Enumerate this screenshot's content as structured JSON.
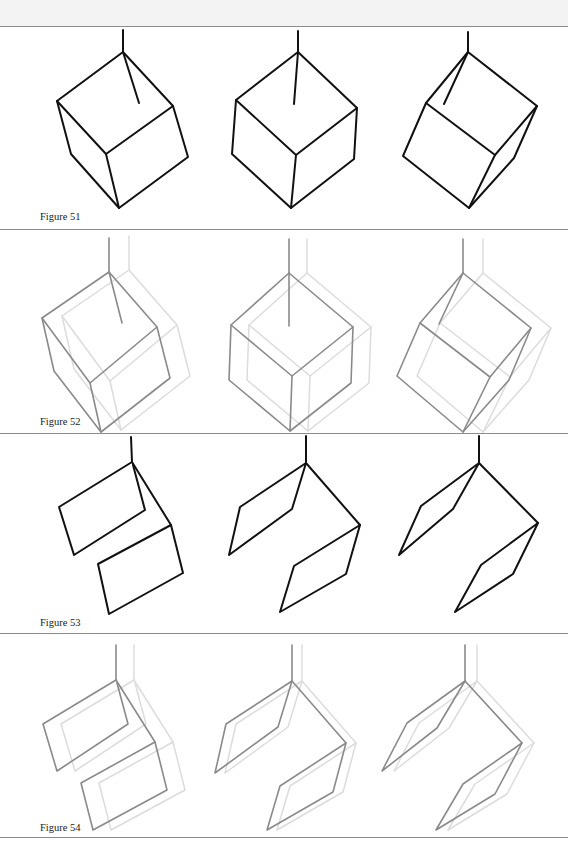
{
  "page": {
    "background": "#ffffff",
    "header_strip_color": "#f3f3f3",
    "rule_color": "#8c8c8c"
  },
  "figures": [
    {
      "id": "51",
      "caption": "Figure 51",
      "style": "solid",
      "stroke": "#111111",
      "description": "Three line-drawn cubes hanging from a vertical stem at the top vertex, each progressively rotated",
      "items": [
        "cube-1",
        "cube-2",
        "cube-3"
      ]
    },
    {
      "id": "52",
      "caption": "Figure 52",
      "style": "gray-with-ghost",
      "stroke": "#8a8a8a",
      "ghost_stroke": "#dcdcdc",
      "description": "The cubes of Figure 51 drawn in gray with faint offset ghost copies",
      "items": [
        "cube-1",
        "cube-2",
        "cube-3"
      ]
    },
    {
      "id": "53",
      "caption": "Figure 53",
      "style": "solid",
      "stroke": "#111111",
      "description": "Three hanging folded two-panel shapes (parallelogram faces hinged at top and right vertex), progressively skewed",
      "items": [
        "folded-shape-1",
        "folded-shape-2",
        "folded-shape-3"
      ]
    },
    {
      "id": "54",
      "caption": "Figure 54",
      "style": "gray-with-ghost",
      "stroke": "#8a8a8a",
      "ghost_stroke": "#dcdcdc",
      "description": "The folded shapes of Figure 53 drawn in gray with faint offset ghost copies",
      "items": [
        "folded-shape-1",
        "folded-shape-2",
        "folded-shape-3"
      ]
    }
  ]
}
